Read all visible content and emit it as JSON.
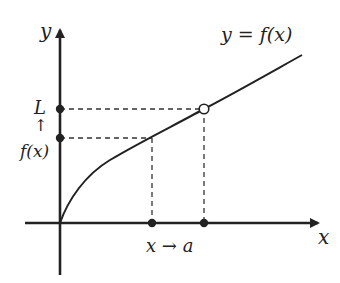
{
  "diagram": {
    "curve_label": "y = f(x)",
    "axes": {
      "x_label": "x",
      "y_label": "y"
    },
    "y_markers": {
      "top_label": "L",
      "arrow_label": "↑",
      "bottom_label": "f(x)"
    },
    "x_markers": {
      "approach_label": "x → a"
    },
    "colors": {
      "line": "#222222",
      "dashed": "#333333",
      "background": "#ffffff"
    }
  }
}
